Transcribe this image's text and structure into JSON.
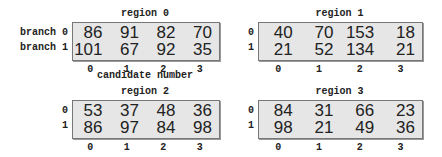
{
  "chart_data": {
    "type": "table",
    "xlabel": "candidate number",
    "row_labels": [
      "branch 0",
      "branch 1"
    ],
    "col_labels": [
      "0",
      "1",
      "2",
      "3"
    ],
    "regions": [
      {
        "title": "region 0",
        "rows": [
          [
            "86",
            "91",
            "82",
            "70"
          ],
          [
            "101",
            "67",
            "92",
            "35"
          ]
        ]
      },
      {
        "title": "region 1",
        "rows": [
          [
            "40",
            "70",
            "153",
            "18"
          ],
          [
            "21",
            "52",
            "134",
            "21"
          ]
        ]
      },
      {
        "title": "region 2",
        "rows": [
          [
            "53",
            "37",
            "48",
            "36"
          ],
          [
            "86",
            "97",
            "84",
            "98"
          ]
        ]
      },
      {
        "title": "region 3",
        "rows": [
          [
            "84",
            "31",
            "66",
            "23"
          ],
          [
            "98",
            "21",
            "49",
            "36"
          ]
        ]
      }
    ]
  },
  "labels": {
    "branch_word": "branch",
    "row0": "0",
    "row1": "1",
    "xlabel": "candidate number"
  }
}
